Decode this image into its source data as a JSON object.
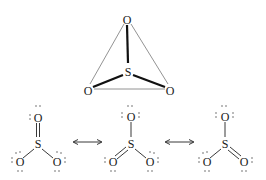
{
  "diagram": {
    "tetrahedral": {
      "center": {
        "label": "S",
        "x": 128,
        "y": 72
      },
      "atoms": [
        {
          "label": "O",
          "x": 127,
          "y": 20
        },
        {
          "label": "O",
          "x": 88,
          "y": 91
        },
        {
          "label": "O",
          "x": 170,
          "y": 91
        }
      ]
    },
    "resonance": [
      {
        "sulfur": "S",
        "oxygens": [
          "O",
          "O",
          "O"
        ],
        "double_bond": "top"
      },
      {
        "sulfur": "S",
        "oxygens": [
          "O",
          "O",
          "O"
        ],
        "double_bond": "left"
      },
      {
        "sulfur": "S",
        "oxygens": [
          "O",
          "O",
          "O"
        ],
        "double_bond": "right"
      }
    ],
    "arrow_symbol": "resonance double-headed arrow"
  }
}
